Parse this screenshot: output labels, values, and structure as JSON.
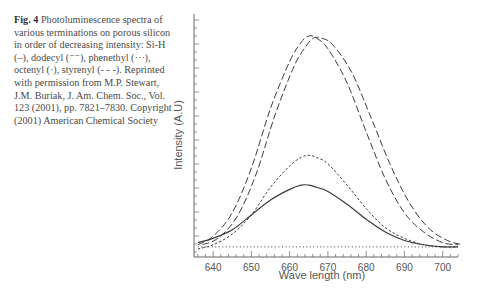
{
  "caption": {
    "label": "Fig. 4",
    "text": "Photoluminescence spectra of various terminations on porous silicon in order of decreasing intensity: Si-H (–), dodecyl (⁻⁻), phenethyl (⋯), octenyl (·), styrenyl (- - -). Reprinted with permission from M.P. Stewart, J.M. Buriak, J. Am. Chem. Soc., Vol. 123 (2001), pp. 7821–7830. Copyright (2001) American Chemical Society"
  },
  "chart_data": {
    "type": "line",
    "title": "",
    "xlabel": "Wave length (nm)",
    "ylabel": "Intensity (A.U)",
    "xlim": [
      635,
      704
    ],
    "ylim": [
      0,
      1
    ],
    "x_ticks": [
      640,
      650,
      660,
      670,
      680,
      690,
      700
    ],
    "y_ticks_labeled": false,
    "grid": false,
    "legend": "none (series identified in caption)",
    "x": [
      636,
      640,
      645,
      650,
      655,
      660,
      663,
      665,
      667,
      670,
      675,
      680,
      685,
      690,
      695,
      700,
      704
    ],
    "series": [
      {
        "name": "Si-H",
        "style": "long-dash",
        "values": [
          0.02,
          0.06,
          0.17,
          0.38,
          0.66,
          0.88,
          0.97,
          1.0,
          0.99,
          0.94,
          0.78,
          0.55,
          0.33,
          0.17,
          0.08,
          0.03,
          0.02
        ]
      },
      {
        "name": "dodecyl",
        "style": "long-dash",
        "values": [
          0.02,
          0.05,
          0.15,
          0.35,
          0.63,
          0.86,
          0.95,
          0.99,
          0.99,
          0.96,
          0.83,
          0.62,
          0.4,
          0.22,
          0.1,
          0.04,
          0.02
        ]
      },
      {
        "name": "phenethyl",
        "style": "short-dash",
        "values": [
          0.0,
          0.02,
          0.07,
          0.16,
          0.29,
          0.39,
          0.43,
          0.44,
          0.43,
          0.4,
          0.3,
          0.19,
          0.1,
          0.05,
          0.02,
          0.01,
          0.01
        ]
      },
      {
        "name": "octenyl",
        "style": "solid",
        "values": [
          0.03,
          0.05,
          0.09,
          0.16,
          0.23,
          0.28,
          0.3,
          0.3,
          0.29,
          0.27,
          0.21,
          0.14,
          0.08,
          0.04,
          0.02,
          0.01,
          0.01
        ]
      },
      {
        "name": "styrenyl",
        "style": "dotted-baseline",
        "values": [
          0.01,
          0.01,
          0.01,
          0.01,
          0.01,
          0.01,
          0.01,
          0.01,
          0.01,
          0.01,
          0.01,
          0.01,
          0.01,
          0.01,
          0.01,
          0.01,
          0.01
        ]
      }
    ]
  },
  "plot": {
    "x_tick_labels": [
      "640",
      "650",
      "660",
      "670",
      "680",
      "690",
      "700"
    ],
    "xlabel": "Wave length (nm)",
    "ylabel": "Intensity (A.U)",
    "line_color": "#3c3c3c"
  }
}
